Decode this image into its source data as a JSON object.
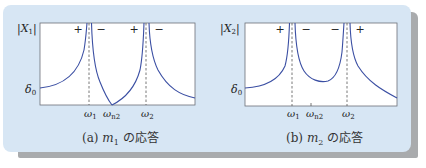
{
  "figure": {
    "background_color": "#d7e6f4",
    "curve_color": "#3b4fa3",
    "dashed_color": "#555555",
    "panels": [
      {
        "id": "a",
        "ylabel": "|X1|",
        "ylabel_var": "X",
        "ylabel_sub": "1",
        "delta_label": "δ",
        "delta_sub": "0",
        "signs": [
          "+",
          "−",
          "+",
          "−"
        ],
        "xticks": [
          {
            "sym": "ω",
            "sub": "1"
          },
          {
            "sym": "ω",
            "sub": "n2"
          },
          {
            "sym": "ω",
            "sub": "2"
          }
        ],
        "caption_prefix": "(a)",
        "caption_var": "m",
        "caption_sub": "1",
        "caption_suffix": "の応答"
      },
      {
        "id": "b",
        "ylabel": "|X2|",
        "ylabel_var": "X",
        "ylabel_sub": "2",
        "delta_label": "δ",
        "delta_sub": "0",
        "signs": [
          "+",
          "−",
          "−",
          "+"
        ],
        "xticks": [
          {
            "sym": "ω",
            "sub": "1"
          },
          {
            "sym": "ω",
            "sub": "n2"
          },
          {
            "sym": "ω",
            "sub": "2"
          }
        ],
        "caption_prefix": "(b)",
        "caption_var": "m",
        "caption_sub": "2",
        "caption_suffix": "の応答"
      }
    ]
  }
}
